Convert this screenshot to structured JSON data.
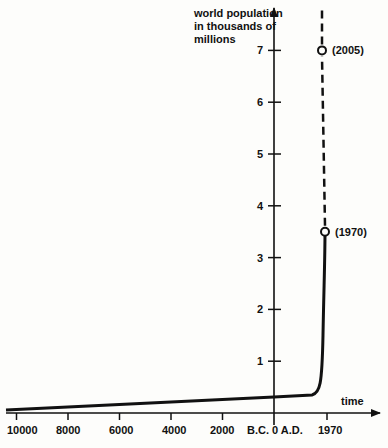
{
  "chart_data": {
    "type": "line",
    "title": "",
    "ylabel": "world population in thousands of millions",
    "ylabel_lines": [
      "world population",
      "in thousands of",
      "millions"
    ],
    "xlabel": "time",
    "ylim": [
      0,
      7.5
    ],
    "y_ticks": [
      1,
      2,
      3,
      4,
      5,
      6,
      7
    ],
    "x_ticks": [
      {
        "label": "10000",
        "year": -10000
      },
      {
        "label": "8000",
        "year": -8000
      },
      {
        "label": "6000",
        "year": -6000
      },
      {
        "label": "4000",
        "year": -4000
      },
      {
        "label": "2000",
        "year": -2000
      },
      {
        "label": "B.C. 0 A.D.",
        "year": 0
      },
      {
        "label": "1970",
        "year": 1970
      }
    ],
    "grid": false,
    "series": [
      {
        "name": "population (historical)",
        "style": "solid",
        "points": [
          {
            "year": -10000,
            "value": 0.01
          },
          {
            "year": -8000,
            "value": 0.05
          },
          {
            "year": -6000,
            "value": 0.1
          },
          {
            "year": -4000,
            "value": 0.15
          },
          {
            "year": -2000,
            "value": 0.2
          },
          {
            "year": 0,
            "value": 0.25
          },
          {
            "year": 1000,
            "value": 0.3
          },
          {
            "year": 1500,
            "value": 0.45
          },
          {
            "year": 1800,
            "value": 1.0
          },
          {
            "year": 1900,
            "value": 1.6
          },
          {
            "year": 1970,
            "value": 3.5
          }
        ]
      },
      {
        "name": "population (projected)",
        "style": "dashed",
        "points": [
          {
            "year": 1970,
            "value": 3.5
          },
          {
            "year": 2005,
            "value": 7.0
          }
        ]
      }
    ],
    "annotations": [
      {
        "text": "(1970)",
        "year": 1970,
        "value": 3.5
      },
      {
        "text": "(2005)",
        "year": 2005,
        "value": 7.0
      }
    ]
  }
}
